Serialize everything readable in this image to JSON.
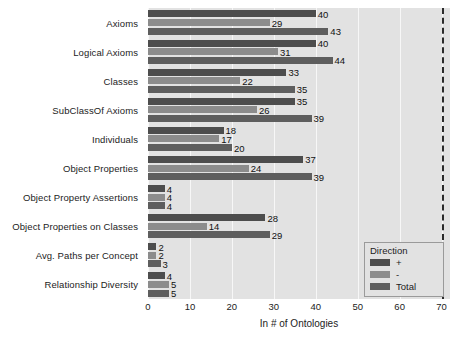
{
  "chart_data": {
    "type": "bar",
    "orientation": "horizontal",
    "title": "",
    "xlabel": "In # of Ontologies",
    "ylabel": "",
    "xlim": [
      0,
      72
    ],
    "xticks": [
      0,
      10,
      20,
      30,
      40,
      50,
      60,
      70
    ],
    "xtick_labels": [
      "0",
      "10",
      "20",
      "30",
      "40",
      "50",
      "60",
      "70"
    ],
    "grid": true,
    "grid_axis": "x",
    "reference_line": {
      "x": 70,
      "style": "dashed",
      "color": "#2b2b2b"
    },
    "legend": {
      "title": "Direction",
      "position": "lower right",
      "entries": [
        {
          "name": "+",
          "color": "#4d4d4d"
        },
        {
          "name": "-",
          "color": "#8c8c8c"
        },
        {
          "name": "Total",
          "color": "#5e5e5e"
        }
      ]
    },
    "categories": [
      "Axioms",
      "Logical Axioms",
      "Classes",
      "SubClassOf Axioms",
      "Individuals",
      "Object Properties",
      "Object Property Assertions",
      "Object Properties on Classes",
      "Avg. Paths per Concept",
      "Relationship Diversity"
    ],
    "series": [
      {
        "name": "+",
        "color": "#4d4d4d",
        "values": [
          40,
          40,
          33,
          35,
          18,
          37,
          4,
          28,
          2,
          4
        ]
      },
      {
        "name": "-",
        "color": "#8c8c8c",
        "values": [
          29,
          31,
          22,
          26,
          17,
          24,
          4,
          14,
          2,
          5
        ]
      },
      {
        "name": "Total",
        "color": "#5e5e5e",
        "values": [
          43,
          44,
          35,
          39,
          20,
          39,
          4,
          29,
          3,
          5
        ]
      }
    ]
  },
  "colors": {
    "panel_background": "#e2e2e2",
    "gridline": "#f7f7f7",
    "figure_background": "#ffffff",
    "text": "#1c1c1c",
    "bar_plus": "#4d4d4d",
    "bar_minus": "#8c8c8c",
    "bar_total": "#5e5e5e",
    "reference_line": "#2b2b2b"
  }
}
